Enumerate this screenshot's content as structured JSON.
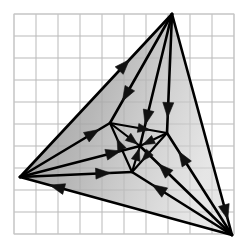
{
  "figure": {
    "type": "geometric-diagram",
    "canvas": {
      "width": 245,
      "height": 252
    },
    "background_color": "#ffffff"
  },
  "grid": {
    "visible": true,
    "origin_x": 14,
    "origin_y": 14,
    "cell_size": 22,
    "columns": 10,
    "rows": 10,
    "line_color": "#b9b9b9",
    "line_width": 1,
    "border_color": "#c9c9c9"
  },
  "style": {
    "edge_color": "#000000",
    "edge_width": 2.6,
    "inner_edge_width": 2.2,
    "arrow_color": "#111111",
    "arrow_length": 15,
    "arrow_half_width": 5.5,
    "inner_arrow_length": 12,
    "inner_arrow_half_width": 4.5,
    "fill_gradient": {
      "type": "linear",
      "angle_deg": 20,
      "stops": [
        {
          "offset": 0,
          "color": "#8d8d8d",
          "opacity": 0.92
        },
        {
          "offset": 0.45,
          "color": "#a8a8a8",
          "opacity": 0.82
        },
        {
          "offset": 1,
          "color": "#d6d6d6",
          "opacity": 0.62
        }
      ]
    }
  },
  "vertices": [
    {
      "id": "T",
      "name": "top-vertex",
      "x": 172,
      "y": 14
    },
    {
      "id": "L",
      "name": "left-vertex",
      "x": 20,
      "y": 177
    },
    {
      "id": "R",
      "name": "bottom-right-vertex",
      "x": 232,
      "y": 235
    },
    {
      "id": "a",
      "name": "inner-upper-left-vertex",
      "x": 110,
      "y": 123
    },
    {
      "id": "b",
      "name": "inner-right-vertex",
      "x": 167,
      "y": 133
    },
    {
      "id": "c",
      "name": "inner-lower-vertex",
      "x": 132,
      "y": 172
    },
    {
      "id": "m",
      "name": "center-vertex",
      "x": 140,
      "y": 146
    }
  ],
  "edges": [
    {
      "name": "edge-outer-left-to-top",
      "from": "L",
      "to": "T",
      "arrow_at": 0.72,
      "class": "outer"
    },
    {
      "name": "edge-outer-top-to-right",
      "from": "T",
      "to": "R",
      "arrow_at": 0.93,
      "class": "outer"
    },
    {
      "name": "edge-outer-right-to-left",
      "from": "R",
      "to": "L",
      "arrow_at": 0.86,
      "class": "outer"
    },
    {
      "name": "edge-left-to-inner-upper-left",
      "from": "L",
      "to": "a",
      "arrow_at": 0.88,
      "class": "spoke"
    },
    {
      "name": "edge-left-to-center",
      "from": "L",
      "to": "m",
      "arrow_at": 0.84,
      "class": "spoke"
    },
    {
      "name": "edge-left-to-inner-lower",
      "from": "L",
      "to": "c",
      "arrow_at": 0.81,
      "class": "spoke"
    },
    {
      "name": "edge-top-to-inner-upper-left",
      "from": "T",
      "to": "a",
      "arrow_at": 0.8,
      "class": "spoke"
    },
    {
      "name": "edge-top-to-center",
      "from": "T",
      "to": "m",
      "arrow_at": 0.84,
      "class": "spoke"
    },
    {
      "name": "edge-top-to-inner-right",
      "from": "T",
      "to": "b",
      "arrow_at": 0.87,
      "class": "spoke"
    },
    {
      "name": "edge-right-to-inner-right",
      "from": "R",
      "to": "b",
      "arrow_at": 0.82,
      "class": "spoke"
    },
    {
      "name": "edge-right-to-center",
      "from": "R",
      "to": "m",
      "arrow_at": 0.8,
      "class": "spoke"
    },
    {
      "name": "edge-right-to-inner-lower",
      "from": "R",
      "to": "c",
      "arrow_at": 0.8,
      "class": "spoke"
    },
    {
      "name": "edge-inner-upper-left-to-inner-right",
      "from": "a",
      "to": "b",
      "arrow_at": 0.7,
      "class": "inner"
    },
    {
      "name": "edge-inner-right-to-inner-lower",
      "from": "b",
      "to": "c",
      "arrow_at": 0.72,
      "class": "inner"
    },
    {
      "name": "edge-inner-lower-to-inner-upper-left",
      "from": "c",
      "to": "a",
      "arrow_at": 0.68,
      "class": "inner"
    },
    {
      "name": "edge-inner-upper-left-to-center",
      "from": "a",
      "to": "m",
      "arrow_at": 0.92,
      "class": "inner"
    },
    {
      "name": "edge-inner-right-to-center",
      "from": "b",
      "to": "m",
      "arrow_at": 0.9,
      "class": "inner"
    },
    {
      "name": "edge-inner-lower-to-center",
      "from": "c",
      "to": "m",
      "arrow_at": 0.9,
      "class": "inner"
    }
  ],
  "faces": [
    {
      "name": "face-outer-triangle",
      "vertices": [
        "T",
        "L",
        "R"
      ],
      "filled": true
    }
  ]
}
